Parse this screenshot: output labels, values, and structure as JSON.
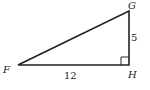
{
  "figure": {
    "type": "right-triangle",
    "vertices": [
      {
        "label": "F"
      },
      {
        "label": "G"
      },
      {
        "label": "H"
      }
    ],
    "sides": {
      "FH": "12",
      "GH": "5"
    },
    "right_angle_at": "H",
    "stroke_color": "#222222",
    "background": "#ffffff"
  }
}
